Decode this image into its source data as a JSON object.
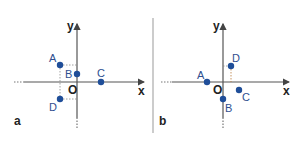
{
  "colors": {
    "axis": "#555555",
    "point": "#1f4e99",
    "label": "#2f4f8f",
    "guide": "#888888",
    "divider": "#999999"
  },
  "panels": [
    {
      "id": "a",
      "label": "a",
      "axes": {
        "x_label": "x",
        "y_label": "y",
        "origin_label": "O"
      },
      "points": [
        {
          "name": "A",
          "label": "A"
        },
        {
          "name": "B",
          "label": "B"
        },
        {
          "name": "C",
          "label": "C"
        },
        {
          "name": "D",
          "label": "D"
        }
      ]
    },
    {
      "id": "b",
      "label": "b",
      "axes": {
        "x_label": "x",
        "y_label": "y",
        "origin_label": "O"
      },
      "points": [
        {
          "name": "A",
          "label": "A"
        },
        {
          "name": "B",
          "label": "B"
        },
        {
          "name": "C",
          "label": "C"
        },
        {
          "name": "D",
          "label": "D"
        }
      ]
    }
  ]
}
